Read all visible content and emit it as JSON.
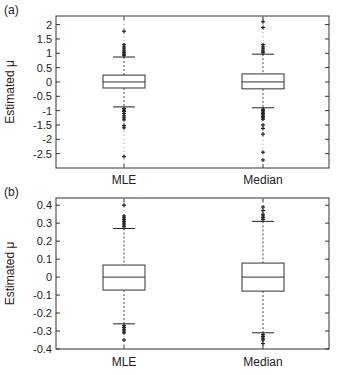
{
  "chart_data": [
    {
      "type": "box",
      "panel_label": "(a)",
      "title": "",
      "xlabel": "",
      "ylabel": "Estimated μ",
      "categories": [
        "MLE",
        "Median"
      ],
      "ylim": [
        -3.0,
        2.3
      ],
      "yticks": [
        2,
        1.5,
        1,
        0.5,
        0,
        -0.5,
        -1,
        -1.5,
        -2,
        -2.5
      ],
      "ytick_labels": [
        "2",
        "1.5",
        "1",
        "0.5",
        "0",
        "-0.5",
        "-1",
        "-1.5",
        "-2",
        "-2.5"
      ],
      "grid": false,
      "series": [
        {
          "name": "MLE",
          "q1": -0.21,
          "median": 0.0,
          "q3": 0.24,
          "whisker_low": -0.87,
          "whisker_high": 0.87,
          "outliers": [
            1.77,
            1.3,
            1.22,
            1.15,
            1.08,
            1.02,
            0.97,
            0.93,
            -0.93,
            -0.98,
            -1.03,
            -1.1,
            -1.18,
            -1.25,
            -1.32,
            -1.52,
            -1.6,
            -2.6
          ]
        },
        {
          "name": "Median",
          "q1": -0.24,
          "median": 0.0,
          "q3": 0.28,
          "whisker_low": -0.9,
          "whisker_high": 0.97,
          "outliers": [
            2.1,
            1.9,
            1.3,
            1.22,
            1.15,
            1.08,
            1.02,
            -0.95,
            -1.0,
            -1.05,
            -1.1,
            -1.15,
            -1.2,
            -1.25,
            -1.3,
            -1.5,
            -1.62,
            -1.82,
            -2.45,
            -2.72
          ]
        }
      ]
    },
    {
      "type": "box",
      "panel_label": "(b)",
      "title": "",
      "xlabel": "",
      "ylabel": "Estimated μ",
      "categories": [
        "MLE",
        "Median"
      ],
      "ylim": [
        -0.4,
        0.44
      ],
      "yticks": [
        0.4,
        0.3,
        0.2,
        0.1,
        0,
        -0.1,
        -0.2,
        -0.3,
        -0.4
      ],
      "ytick_labels": [
        "0.4",
        "0.3",
        "0.2",
        "0.1",
        "0",
        "-0.1",
        "-0.2",
        "-0.3",
        "-0.4"
      ],
      "grid": false,
      "series": [
        {
          "name": "MLE",
          "q1": -0.072,
          "median": 0.0,
          "q3": 0.067,
          "whisker_low": -0.26,
          "whisker_high": 0.27,
          "outliers": [
            0.4,
            0.34,
            0.33,
            0.32,
            0.31,
            0.3,
            0.29,
            0.28,
            -0.27,
            -0.28,
            -0.29,
            -0.3,
            -0.31,
            -0.35
          ]
        },
        {
          "name": "Median",
          "q1": -0.078,
          "median": 0.0,
          "q3": 0.078,
          "whisker_low": -0.31,
          "whisker_high": 0.31,
          "outliers": [
            0.39,
            0.37,
            0.35,
            0.34,
            0.33,
            0.32,
            -0.32,
            -0.33,
            -0.34,
            -0.35,
            -0.37
          ]
        }
      ]
    }
  ]
}
